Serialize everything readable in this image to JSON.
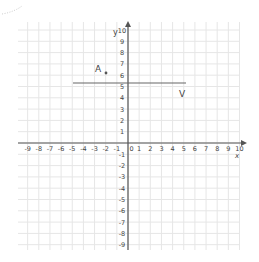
{
  "graph": {
    "x_axis_label": "x",
    "y_axis_label": "y",
    "x_ticks": [
      "-9",
      "-8",
      "-7",
      "-6",
      "-5",
      "-4",
      "-3",
      "-2",
      "-1",
      "0",
      "1",
      "2",
      "3",
      "4",
      "5",
      "6",
      "7",
      "8",
      "9",
      "10"
    ],
    "y_ticks": [
      "10",
      "9",
      "8",
      "7",
      "6",
      "5",
      "4",
      "3",
      "2",
      "1",
      "-1",
      "-2",
      "-3",
      "-4",
      "-5",
      "-6",
      "-7",
      "-8",
      "-9"
    ],
    "point_label": "A",
    "line_label": "V",
    "colors": {
      "grid": "#e6e6e6",
      "axis": "#555555",
      "line": "#666666",
      "text": "#444444"
    }
  },
  "chart_data": {
    "type": "scatter",
    "title": "",
    "xlabel": "x",
    "ylabel": "y",
    "xlim": [
      -9,
      10
    ],
    "ylim": [
      -9,
      10
    ],
    "grid": true,
    "points": [
      {
        "label": "A",
        "x": -1,
        "y": 6
      }
    ],
    "lines": [
      {
        "label": "V",
        "type": "horizontal",
        "y": 5,
        "x_start": -5,
        "x_end": 5.2
      }
    ]
  }
}
